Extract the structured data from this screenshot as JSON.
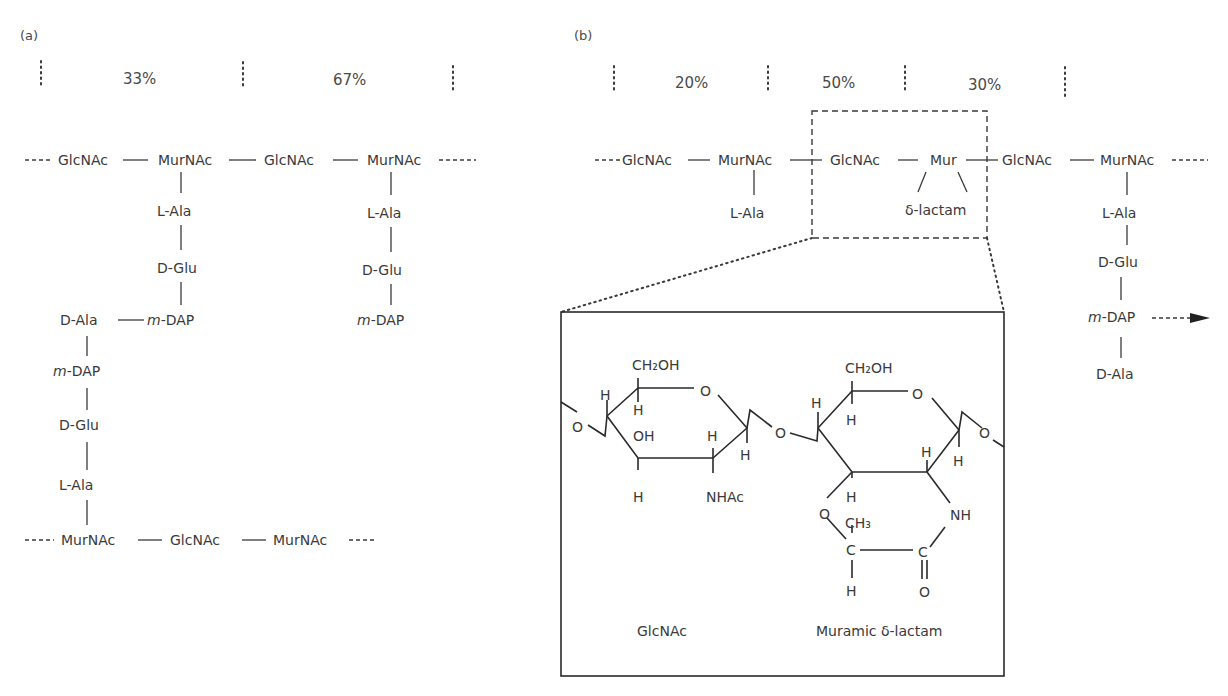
{
  "panel_a": {
    "label": "(a)",
    "percentages": [
      "33%",
      "67%"
    ],
    "top_chain": [
      "GlcNAc",
      "MurNAc",
      "GlcNAc",
      "MurNAc"
    ],
    "left_stem": [
      "L-Ala",
      "D-Glu",
      "m-DAP"
    ],
    "right_stem": [
      "L-Ala",
      "D-Glu",
      "m-DAP"
    ],
    "crosslink": {
      "d_ala": "D-Ala",
      "m_dap": "m-DAP",
      "d_glu": "D-Glu",
      "l_ala": "L-Ala"
    },
    "bottom_chain": [
      "MurNAc",
      "GlcNAc",
      "MurNAc"
    ]
  },
  "panel_b": {
    "label": "(b)",
    "percentages": [
      "20%",
      "50%",
      "30%"
    ],
    "chain": [
      "GlcNAc",
      "MurNAc",
      "GlcNAc",
      "Mur",
      "GlcNAc",
      "MurNAc"
    ],
    "left_stem": [
      "L-Ala"
    ],
    "lactam_label": "δ-lactam",
    "right_stem": [
      "L-Ala",
      "D-Glu",
      "m-DAP",
      "D-Ala"
    ],
    "inset": {
      "left_sugar": {
        "substituents": [
          "CH₂OH",
          "O",
          "H",
          "H",
          "OH",
          "H",
          "H",
          "H",
          "NHAc"
        ],
        "caption": "GlcNAc"
      },
      "right_sugar": {
        "substituents": [
          "CH₂OH",
          "O",
          "H",
          "H",
          "H",
          "H",
          "H",
          "O",
          "CH₃",
          "C",
          "C",
          "NH",
          "H",
          "O"
        ],
        "caption": "Muramic δ-lactam"
      },
      "glycosidic_oxygens": [
        "O",
        "O",
        "O"
      ]
    }
  }
}
